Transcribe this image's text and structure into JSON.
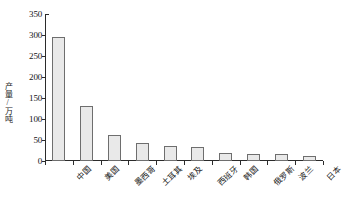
{
  "chart_data": {
    "type": "bar",
    "title": "",
    "xlabel": "",
    "ylabel": "产量/万吨",
    "ylim": [
      0,
      350
    ],
    "ytick_step": 50,
    "yticks": [
      0,
      50,
      100,
      150,
      200,
      250,
      300,
      350
    ],
    "ytick_labels": [
      "0",
      "50",
      "100",
      "150",
      "200",
      "250",
      "300",
      "350"
    ],
    "grid": false,
    "legend": false,
    "categories": [
      "中国",
      "美国",
      "墨西哥",
      "土耳其",
      "埃及",
      "西班牙",
      "韩国",
      "俄罗斯",
      "波兰",
      "日本"
    ],
    "values": [
      295,
      130,
      63,
      42,
      35,
      34,
      19,
      17,
      16,
      13
    ],
    "bar_fill": "#e9e9e9",
    "bar_edge": "#6e6e6e",
    "axis_color": "#2b2b2b"
  }
}
